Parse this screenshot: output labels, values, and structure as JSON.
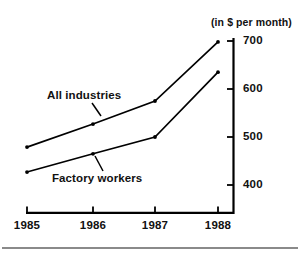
{
  "chart_data": {
    "type": "line",
    "title": "(in $ per month)",
    "xlabel": "",
    "ylabel": "",
    "categories": [
      "1985",
      "1986",
      "1987",
      "1988"
    ],
    "x": [
      1985,
      1986,
      1987,
      1988
    ],
    "series": [
      {
        "name": "All industries",
        "values": [
          479,
          527,
          575,
          698
        ]
      },
      {
        "name": "Factory workers",
        "values": [
          427,
          465,
          500,
          635
        ]
      }
    ],
    "yticks": [
      400,
      500,
      600,
      700
    ],
    "ytick_labels": [
      "400",
      "500",
      "600",
      "700"
    ],
    "ylim": [
      352,
      710
    ],
    "xlim": [
      1984.85,
      1988.25
    ],
    "grid": false,
    "legend": "inline-annotations",
    "line_color": "#000000",
    "axis_color": "#000000",
    "marker": "dot"
  },
  "annotations": {
    "all_industries": {
      "label": "All industries",
      "leader_from": [
        92,
        103
      ],
      "leader_to": [
        101,
        116
      ]
    },
    "factory_workers": {
      "label": "Factory workers",
      "leader_from": [
        103,
        171
      ],
      "leader_to": [
        95,
        156
      ]
    }
  },
  "axes": {
    "unit_caption": "(in $ per month)",
    "y_axis_position": "right",
    "x_axis_position": "bottom"
  }
}
